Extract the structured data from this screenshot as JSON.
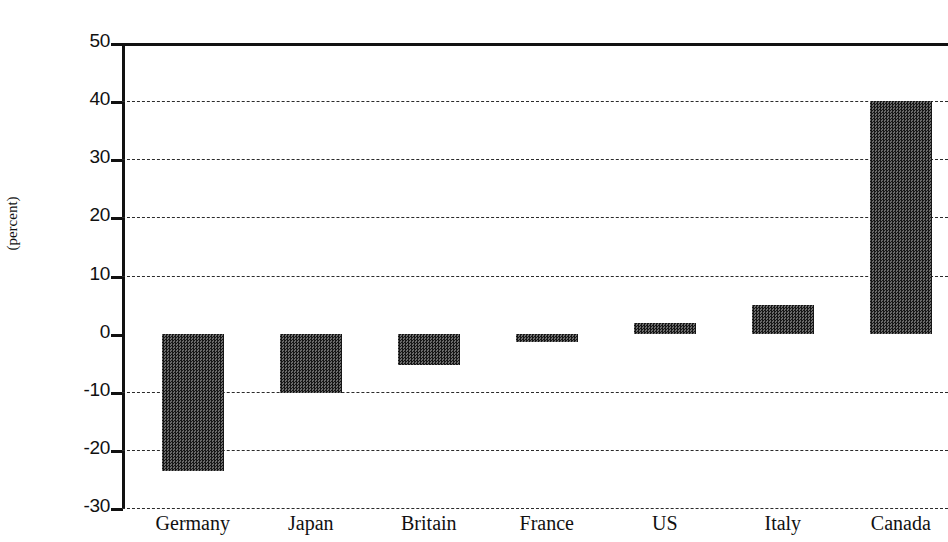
{
  "chart_data": {
    "type": "bar",
    "title": "",
    "xlabel": "",
    "ylabel": "(percent)",
    "categories": [
      "Germany",
      "Japan",
      "Britain",
      "France",
      "US",
      "Italy",
      "Canada"
    ],
    "values": [
      -23.6,
      -10.3,
      -5.4,
      -1.5,
      1.8,
      4.9,
      40.0
    ],
    "ylim": [
      -30,
      50
    ],
    "ytick_labels": [
      "50",
      "40",
      "30",
      "20",
      "10",
      "0",
      "-10",
      "-20",
      "-30"
    ],
    "ytick_values": [
      50,
      40,
      30,
      20,
      10,
      0,
      -10,
      -20,
      -30
    ],
    "grid": true,
    "grid_style": "dashed",
    "legend": "none",
    "bar_color": "#3a3a3a",
    "axis_color": "#111111"
  },
  "figure": {
    "title_clipped": ""
  }
}
